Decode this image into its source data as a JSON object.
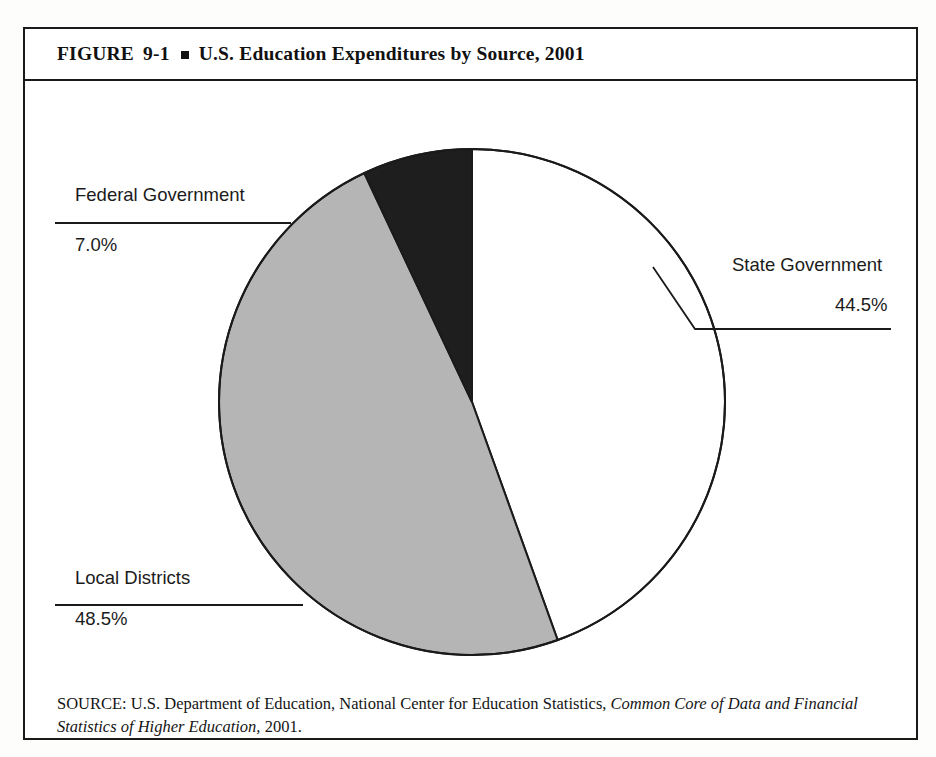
{
  "figure": {
    "label": "FIGURE",
    "number": "9-1",
    "bullet": "square-bullet",
    "title": "U.S. Education Expenditures by Source, 2001"
  },
  "source": {
    "prefix": "SOURCE: U.S. Department of Education, National Center for Education Statistics, ",
    "italic": "Common Core of Data and Financial Statistics of Higher Education,",
    "suffix": " 2001."
  },
  "labels": {
    "federal_name": "Federal Government",
    "federal_pct": "7.0%",
    "state_name": "State Government",
    "state_pct": "44.5%",
    "local_name": "Local Districts",
    "local_pct": "48.5%"
  },
  "colors": {
    "state": "#ffffff",
    "local": "#b5b5b5",
    "federal": "#1e1e1e",
    "outline": "#1a1a1a",
    "text": "#1b1b1b"
  },
  "chart_data": {
    "type": "pie",
    "title": "U.S. Education Expenditures by Source, 2001",
    "categories": [
      "State Government",
      "Local Districts",
      "Federal Government"
    ],
    "values": [
      44.5,
      48.5,
      7.0
    ],
    "unit": "percent",
    "labels": [
      "44.5%",
      "48.5%",
      "7.0%"
    ],
    "colors": [
      "#ffffff",
      "#b5b5b5",
      "#1e1e1e"
    ],
    "start_angle_deg": 0,
    "direction": "clockwise",
    "legend": "none",
    "grid": false,
    "annotations": [
      "Federal Government 7.0%",
      "State Government 44.5%",
      "Local Districts 48.5%"
    ]
  }
}
